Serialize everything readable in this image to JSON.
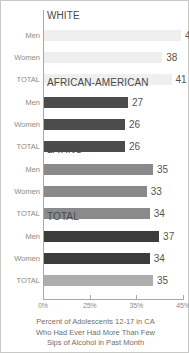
{
  "chart_data": {
    "type": "bar",
    "orientation": "horizontal",
    "title": "",
    "xlabel": "",
    "ylabel": "",
    "xlim": [
      0,
      45
    ],
    "grid": false,
    "legend": "none",
    "axis_ticks": [
      "0%",
      "25%",
      "35%",
      "45%"
    ],
    "axis_tick_values": [
      0,
      25,
      35,
      45
    ],
    "caption_lines": [
      "Percent of Adolescents 12-17 in CA",
      "Who Had Ever Had More Than Few",
      "Sips of Alcohol in Past Month"
    ],
    "groups": [
      {
        "name": "WHITE",
        "bar_color": "#efefef",
        "categories": [
          "Men",
          "Women",
          "TOTAL"
        ],
        "values": [
          44,
          38,
          41
        ]
      },
      {
        "name": "AFRICAN-AMERICAN",
        "bar_color": "#4b4b4b",
        "categories": [
          "Men",
          "Women",
          "TOTAL"
        ],
        "values": [
          27,
          26,
          26
        ]
      },
      {
        "name": "LATINO",
        "bar_color": "#8a8a8a",
        "categories": [
          "Men",
          "Women",
          "TOTAL"
        ],
        "values": [
          35,
          33,
          34
        ]
      },
      {
        "name": "TOTAL",
        "bar_color": "#3c3c3c",
        "total_bar_color": "#adadad",
        "categories": [
          "Men",
          "Women",
          "TOTAL"
        ],
        "values": [
          37,
          34,
          35
        ]
      }
    ]
  }
}
